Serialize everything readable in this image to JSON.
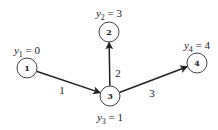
{
  "diagram": {
    "type": "directed-graph",
    "colors": {
      "stroke": "#222222",
      "node_stroke": "#444444",
      "background": "#ffffff"
    },
    "nodes": [
      {
        "id": "1",
        "label": "1",
        "x": 27,
        "y": 68,
        "r": 10,
        "potential": {
          "var": "y",
          "sub": "1",
          "value": "0",
          "lx": 27,
          "ly": 54
        }
      },
      {
        "id": "2",
        "label": "2",
        "x": 109,
        "y": 32,
        "r": 10,
        "potential": {
          "var": "y",
          "sub": "2",
          "value": "3",
          "lx": 109,
          "ly": 17
        }
      },
      {
        "id": "3",
        "label": "3",
        "x": 110,
        "y": 96,
        "r": 10,
        "potential": {
          "var": "y",
          "sub": "3",
          "value": "1",
          "lx": 110,
          "ly": 121
        }
      },
      {
        "id": "4",
        "label": "4",
        "x": 197,
        "y": 63,
        "r": 10,
        "potential": {
          "var": "y",
          "sub": "4",
          "value": "4",
          "lx": 197,
          "ly": 49
        }
      }
    ],
    "edges": [
      {
        "from": "1",
        "to": "3",
        "label": "1",
        "lx": 62,
        "ly": 90
      },
      {
        "from": "3",
        "to": "2",
        "label": "2",
        "lx": 118,
        "ly": 73
      },
      {
        "from": "3",
        "to": "4",
        "label": "3",
        "lx": 152,
        "ly": 93
      }
    ]
  }
}
